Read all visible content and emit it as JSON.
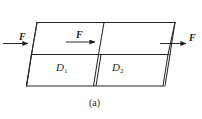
{
  "figure": {
    "caption": "(a)",
    "type": "oblique-projection-prism",
    "stroke_color": "#262626",
    "background_color": "#ffffff"
  },
  "forces": [
    {
      "id": "left",
      "label": "F",
      "direction": "right",
      "location": "left-end-face"
    },
    {
      "id": "middle",
      "label": "F",
      "direction": "right",
      "location": "interior-section-plane"
    },
    {
      "id": "right",
      "label": "F",
      "direction": "right",
      "location": "right-end-face"
    }
  ],
  "regions": [
    {
      "id": "d1",
      "label": "D",
      "subscript": "1"
    },
    {
      "id": "d2",
      "label": "D",
      "subscript": "2"
    }
  ]
}
